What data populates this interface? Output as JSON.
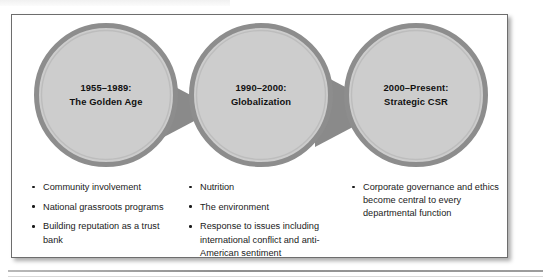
{
  "figure": {
    "colors": {
      "circle_fill": "#cdcdcd",
      "circle_ring": "#8d8d8d",
      "circle_ring_inner": "#b4b4b4",
      "arrow_fill": "#8a8a8a",
      "frame_border": "#6d6d6d",
      "text": "#111111",
      "background": "#ffffff"
    },
    "stages": [
      {
        "id": "golden-age",
        "line1": "1955–1989:",
        "line2": "The Golden Age",
        "bullets": [
          "Community involvement",
          "National grassroots programs",
          "Building reputation as a trust bank"
        ]
      },
      {
        "id": "globalization",
        "line1": "1990–2000:",
        "line2": "Globalization",
        "bullets": [
          "Nutrition",
          "The environment",
          "Response to issues including international conflict and anti-American sentiment"
        ]
      },
      {
        "id": "strategic-csr",
        "line1": "2000–Present:",
        "line2": "Strategic CSR",
        "bullets": [
          "Corporate governance and ethics become central to every departmental function"
        ]
      }
    ]
  }
}
